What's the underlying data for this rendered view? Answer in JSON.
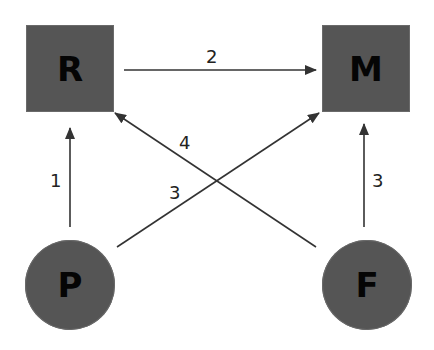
{
  "diagram": {
    "nodes": [
      {
        "id": "R",
        "label": "R",
        "shape": "square"
      },
      {
        "id": "M",
        "label": "M",
        "shape": "square"
      },
      {
        "id": "P",
        "label": "P",
        "shape": "circle"
      },
      {
        "id": "F",
        "label": "F",
        "shape": "circle"
      }
    ],
    "edges": [
      {
        "from": "R",
        "to": "M",
        "label": "2"
      },
      {
        "from": "P",
        "to": "R",
        "label": "1"
      },
      {
        "from": "P",
        "to": "M",
        "label": "3"
      },
      {
        "from": "F",
        "to": "R",
        "label": "4"
      },
      {
        "from": "F",
        "to": "M",
        "label": "3"
      }
    ],
    "colors": {
      "node_fill": "#555555",
      "node_text": "#050505",
      "edge": "#333333",
      "background": "#ffffff"
    }
  }
}
